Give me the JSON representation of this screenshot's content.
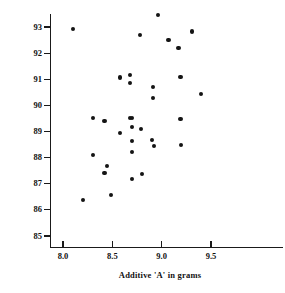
{
  "chart_data": {
    "type": "scatter",
    "title": "",
    "xlabel": "Additive 'A' in grams",
    "ylabel": "Yield in %",
    "xlim": [
      7.85,
      9.82
    ],
    "ylim": [
      84.45,
      93.45
    ],
    "xticks": [
      8.0,
      8.5,
      9.0,
      9.5
    ],
    "xtick_labels": [
      "8.0",
      "8.5",
      "9.0",
      "9.5"
    ],
    "yticks": [
      85,
      86,
      87,
      88,
      89,
      90,
      91,
      92,
      93
    ],
    "ytick_labels": [
      "85",
      "86",
      "87",
      "88",
      "89",
      "90",
      "91",
      "92",
      "93"
    ],
    "grid": false,
    "legend": null,
    "marker": "filled-circle",
    "marker_color": "#141414",
    "points": [
      {
        "x": 8.1,
        "y": 92.93
      },
      {
        "x": 8.2,
        "y": 86.38
      },
      {
        "x": 8.3,
        "y": 89.53
      },
      {
        "x": 8.3,
        "y": 88.1
      },
      {
        "x": 8.42,
        "y": 89.4
      },
      {
        "x": 8.42,
        "y": 87.4
      },
      {
        "x": 8.45,
        "y": 87.68
      },
      {
        "x": 8.49,
        "y": 86.58
      },
      {
        "x": 8.58,
        "y": 91.07
      },
      {
        "x": 8.58,
        "y": 88.93
      },
      {
        "x": 8.68,
        "y": 91.17
      },
      {
        "x": 8.68,
        "y": 90.86
      },
      {
        "x": 8.68,
        "y": 89.53
      },
      {
        "x": 8.7,
        "y": 89.53
      },
      {
        "x": 8.7,
        "y": 89.18
      },
      {
        "x": 8.7,
        "y": 88.63
      },
      {
        "x": 8.7,
        "y": 88.23
      },
      {
        "x": 8.7,
        "y": 87.18
      },
      {
        "x": 8.78,
        "y": 92.7
      },
      {
        "x": 8.79,
        "y": 89.1
      },
      {
        "x": 8.8,
        "y": 87.36
      },
      {
        "x": 8.9,
        "y": 88.68
      },
      {
        "x": 8.91,
        "y": 90.7
      },
      {
        "x": 8.91,
        "y": 90.28
      },
      {
        "x": 8.92,
        "y": 88.44
      },
      {
        "x": 8.96,
        "y": 93.45
      },
      {
        "x": 9.07,
        "y": 92.5
      },
      {
        "x": 9.17,
        "y": 92.2
      },
      {
        "x": 9.19,
        "y": 91.08
      },
      {
        "x": 9.19,
        "y": 89.48
      },
      {
        "x": 9.2,
        "y": 88.48
      },
      {
        "x": 9.31,
        "y": 92.83
      },
      {
        "x": 9.4,
        "y": 90.42
      }
    ]
  },
  "figure": {
    "background_color": "#ffffff",
    "axis_color": "#1a1a1a",
    "text_color": "#111111"
  }
}
